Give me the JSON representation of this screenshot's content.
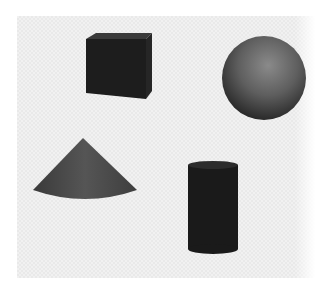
{
  "scene": {
    "background": "light checkered panel",
    "shapes": [
      {
        "name": "cube",
        "color": "#1e1e1e",
        "position": "top-left"
      },
      {
        "name": "sphere",
        "color": "#5a5a5a",
        "position": "top-right"
      },
      {
        "name": "cone",
        "color": "#4a4a4a",
        "position": "bottom-left"
      },
      {
        "name": "cylinder",
        "color": "#1a1a1a",
        "position": "bottom-right"
      }
    ]
  }
}
